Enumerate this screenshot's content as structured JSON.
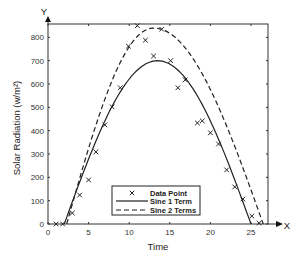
{
  "chart_data": {
    "type": "line",
    "title": "",
    "xlabel": "Time",
    "ylabel": "Solar Radiation (w/m²)",
    "x_axis_arrow_label": "X",
    "y_axis_arrow_label": "Y",
    "xlim": [
      0,
      27
    ],
    "ylim": [
      0,
      860
    ],
    "xticks": [
      0,
      5,
      10,
      15,
      20,
      25
    ],
    "yticks": [
      0,
      100,
      200,
      300,
      400,
      500,
      600,
      700,
      800
    ],
    "grid": false,
    "legend_position": "lower center",
    "legend": [
      "Data Point",
      "Sine 1 Term",
      "Sine 2 Terms"
    ],
    "series": [
      {
        "name": "Data Point",
        "style": "x-marker",
        "points": [
          [
            1,
            0
          ],
          [
            1.8,
            0
          ],
          [
            3,
            47
          ],
          [
            3.9,
            124
          ],
          [
            5,
            189
          ],
          [
            5.9,
            309
          ],
          [
            7,
            425
          ],
          [
            7.9,
            502
          ],
          [
            8.9,
            584
          ],
          [
            9.9,
            762
          ],
          [
            11,
            850
          ],
          [
            12,
            788
          ],
          [
            13,
            720
          ],
          [
            14,
            835
          ],
          [
            15.1,
            700
          ],
          [
            16,
            584
          ],
          [
            16.9,
            618
          ],
          [
            18.4,
            433
          ],
          [
            19,
            442
          ],
          [
            20,
            391
          ],
          [
            21,
            343
          ],
          [
            22,
            232
          ],
          [
            23,
            159
          ],
          [
            24,
            107
          ],
          [
            25.1,
            34
          ],
          [
            26,
            4
          ]
        ]
      },
      {
        "name": "Sine 1 Term",
        "style": "solid",
        "start_x": 2.0,
        "end_x": 25.0,
        "peak_x": 13.5,
        "peak_y": 700
      },
      {
        "name": "Sine 2 Terms",
        "style": "dashed",
        "start_x": 2.3,
        "end_x": 26.5,
        "peak_x": 13.0,
        "peak_y": 840
      }
    ]
  },
  "colors": {
    "line": "#222222",
    "axis": "#333333",
    "background": "#ffffff"
  }
}
